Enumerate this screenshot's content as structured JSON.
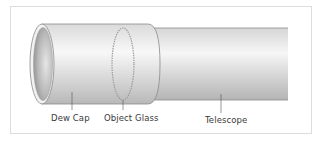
{
  "diagram": {
    "labels": [
      {
        "id": "dew-cap",
        "text": "Dew Cap"
      },
      {
        "id": "object-glass",
        "text": "Object Glass"
      },
      {
        "id": "telescope",
        "text": "Telescope"
      }
    ]
  },
  "colors": {
    "frame_border": "#dcdcdc",
    "tube_outline": "#8a8a8a",
    "tube_light": "#f4f4f4",
    "tube_dark": "#b8b8b8",
    "inner_shadow": "#9a9a9a",
    "label_text": "#3a3a3a"
  }
}
